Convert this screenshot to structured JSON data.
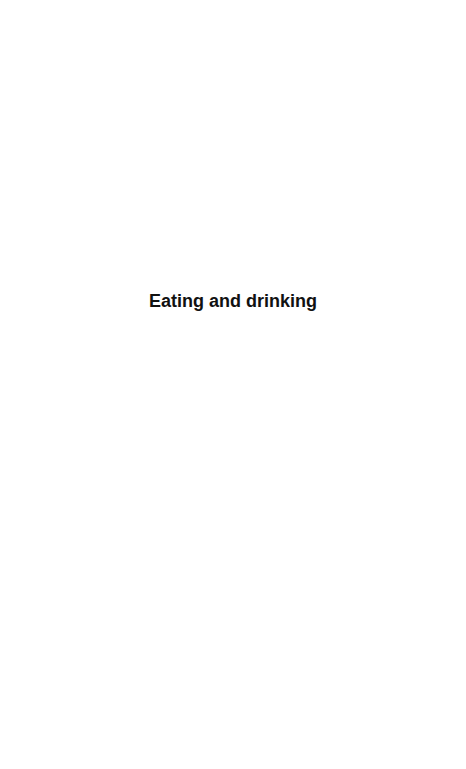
{
  "document": {
    "title": "Eating and drinking"
  }
}
